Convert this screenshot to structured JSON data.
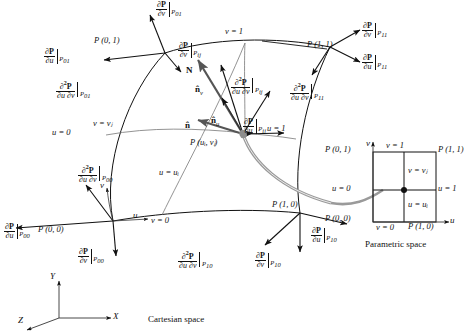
{
  "figure": {
    "caption_cartesian": "Cartesian space",
    "caption_parametric": "Parametric space"
  },
  "axes": {
    "x": "X",
    "y": "Y",
    "z": "Z"
  },
  "surface_points": {
    "p00": "P (0, 0)",
    "p01": "P (0, 1)",
    "p10": "P (1, 0)",
    "p11": "P (1, 1)",
    "pij": "P (uᵢ, vⱼ)"
  },
  "surface_curve_labels": {
    "v_eq_1": "v = 1",
    "v_eq_0": "v = 0",
    "u_eq_0": "u = 0",
    "u_eq_1": "u = 1",
    "v_eq_vj": "v = vⱼ",
    "u_eq_ui": "u = uᵢ"
  },
  "local_axes": {
    "u": "u",
    "v": "v"
  },
  "vectors": {
    "normal": "N",
    "n_hat": "n̂",
    "n_hat_u": "n̂",
    "n_hat_u_sub": "u",
    "n_hat_v": "n̂",
    "n_hat_v_sub": "v"
  },
  "derivatives": [
    {
      "id": "dPdv-P01",
      "num": "∂P",
      "den": "∂v",
      "sub": "P₀₁",
      "kind": "first"
    },
    {
      "id": "dPdu-P01",
      "num": "∂P",
      "den": "∂u",
      "sub": "P₀₁",
      "kind": "first"
    },
    {
      "id": "d2Pdudv-P01",
      "num": "∂²P",
      "den": "∂u ∂v",
      "sub": "P₀₁",
      "kind": "mixed"
    },
    {
      "id": "dPdv-Pij",
      "num": "∂P",
      "den": "∂v",
      "sub": "Pᵢⱼ",
      "kind": "first"
    },
    {
      "id": "dPdu-Pij",
      "num": "∂P",
      "den": "∂u",
      "sub": "Pᵢⱼ",
      "kind": "first"
    },
    {
      "id": "d2Pdudv-Pij",
      "num": "∂²P",
      "den": "∂u ∂v",
      "sub": "Pᵢⱼ",
      "kind": "mixed"
    },
    {
      "id": "dPdv-P11",
      "num": "∂P",
      "den": "∂v",
      "sub": "P₁₁",
      "kind": "first"
    },
    {
      "id": "dPdu-P11",
      "num": "∂P",
      "den": "∂u",
      "sub": "P₁₁",
      "kind": "first"
    },
    {
      "id": "d2Pdudv-P11",
      "num": "∂²P",
      "den": "∂u ∂v",
      "sub": "P₁₁",
      "kind": "mixed"
    },
    {
      "id": "dPdu-P00",
      "num": "∂P",
      "den": "∂u",
      "sub": "P₀₀",
      "kind": "first"
    },
    {
      "id": "dPdv-P00",
      "num": "∂P",
      "den": "∂v",
      "sub": "P₀₀",
      "kind": "first"
    },
    {
      "id": "d2Pdudv-P00",
      "num": "∂²P",
      "den": "∂u ∂v",
      "sub": "P₀₀",
      "kind": "mixed"
    },
    {
      "id": "dPdu-P10",
      "num": "∂P",
      "den": "∂u",
      "sub": "P₁₀",
      "kind": "first"
    },
    {
      "id": "dPdv-P10",
      "num": "∂P",
      "den": "∂v",
      "sub": "P₁₀",
      "kind": "first"
    },
    {
      "id": "d2Pdudv-P10",
      "num": "∂²P",
      "den": "∂u ∂v",
      "sub": "P₁₀",
      "kind": "mixed"
    }
  ],
  "parametric_space": {
    "axis_u": "u",
    "axis_v": "v",
    "top": "v = 1",
    "bottom": "v = 0",
    "left": "u = 0",
    "right": "u = 1",
    "inner_v": "v = vⱼ",
    "inner_u": "u = uᵢ",
    "corner_00": "P (0, 0)",
    "corner_01": "P (0, 1)",
    "corner_10": "P (1, 0)",
    "corner_11": "P (1, 1)"
  },
  "colors": {
    "line": "#111111",
    "thin_line": "#6a6a6a",
    "highlight": "#8a8a8a",
    "background": "#ffffff"
  }
}
